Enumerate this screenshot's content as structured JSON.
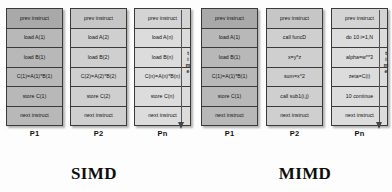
{
  "diagram": {
    "panels": [
      {
        "id": "simd",
        "caption": "SIMD",
        "time_label": "time",
        "processors": [
          {
            "label": "P1",
            "shade": "shade-dark",
            "cells": [
              "prev instruct",
              "load A(1)",
              "load B(1)",
              "C(1)=A(1)*B(1)",
              "store C(1)",
              "next instruct"
            ]
          },
          {
            "label": "P2",
            "shade": "shade-mid",
            "cells": [
              "prev instruct",
              "load A(2)",
              "load B(2)",
              "C(2)=A(2)*B(2)",
              "store C(2)",
              "next instruct"
            ]
          },
          {
            "label": "Pn",
            "shade": "shade-light",
            "cells": [
              "prev instruct",
              "load A(n)",
              "load B(n)",
              "C(n)=A(n)*B(n)",
              "store C(n)",
              "next instruct"
            ]
          }
        ]
      },
      {
        "id": "mimd",
        "caption": "MIMD",
        "time_label": "time",
        "processors": [
          {
            "label": "P1",
            "shade": "shade-dark",
            "cells": [
              "prev instruct",
              "load A(1)",
              "load B(1)",
              "C(1)=A(1)*B(1)",
              "store C(1)",
              "next instruct"
            ]
          },
          {
            "label": "P2",
            "shade": "shade-mid",
            "cells": [
              "prev instruct",
              "call funcD",
              "x=y*z",
              "sum=x^2",
              "call sub1(i,j)",
              "next instruct"
            ]
          },
          {
            "label": "Pn",
            "shade": "shade-light",
            "cells": [
              "prev instruct",
              "do 10 i=1,N",
              "alpha=w**3",
              "zeta=C(i)",
              "10 continue",
              "next instruct"
            ]
          }
        ]
      }
    ]
  }
}
